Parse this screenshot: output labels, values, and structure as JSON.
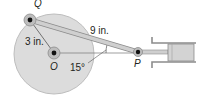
{
  "diagram": {
    "points": {
      "Q": "Q",
      "O": "O",
      "P": "P"
    },
    "labels": {
      "crank_length": "3 in.",
      "rod_length": "9 in.",
      "angle": "15°"
    },
    "colors": {
      "disk": "#d9d9d9",
      "disk_edge": "#b8b8b8",
      "rod": "#c8c8c8",
      "rod_edge": "#8c8c8c",
      "pin": "#111111",
      "text": "#231f20"
    }
  }
}
